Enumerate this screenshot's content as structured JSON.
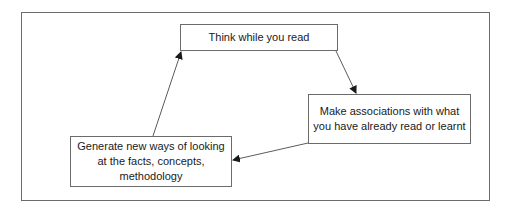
{
  "diagram": {
    "type": "cycle",
    "nodes": [
      {
        "id": "think",
        "label": "Think while you read"
      },
      {
        "id": "associate",
        "label": "Make associations with what you have already read or learnt"
      },
      {
        "id": "generate",
        "label": "Generate new ways of looking at the facts, concepts, methodology"
      }
    ],
    "edges": [
      {
        "from": "think",
        "to": "associate"
      },
      {
        "from": "associate",
        "to": "generate"
      },
      {
        "from": "generate",
        "to": "think"
      }
    ],
    "colors": {
      "border": "#6b6b6b",
      "arrow": "#3a3a3a",
      "background": "#ffffff",
      "text": "#1a1a1a"
    }
  }
}
